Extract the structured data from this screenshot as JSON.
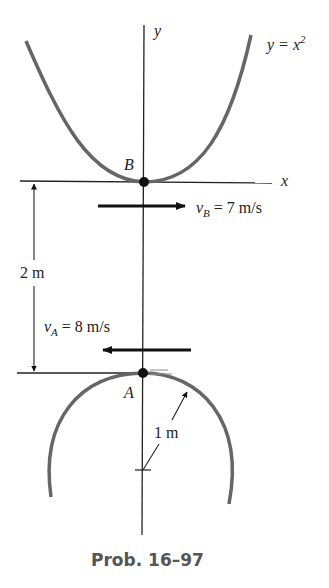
{
  "diagram": {
    "curve_label": "y = x",
    "curve_exponent": "2",
    "y_axis_label": "y",
    "x_axis_label": "x",
    "point_b_label": "B",
    "point_a_label": "A",
    "vb_symbol": "v",
    "vb_sub": "B",
    "vb_value": "= 7 m/s",
    "va_symbol": "v",
    "va_sub": "A",
    "va_value": "= 8 m/s",
    "distance_label": "2 m",
    "radius_label": "1 m",
    "caption": "Prob. 16–97"
  }
}
